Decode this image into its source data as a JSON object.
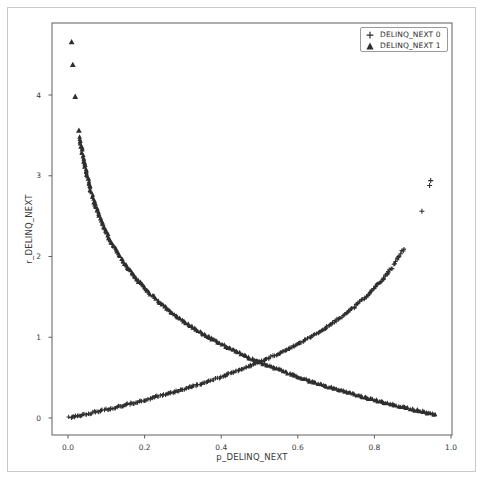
{
  "chart_data": {
    "type": "scatter",
    "title": "",
    "xlabel": "p_DELINQ_NEXT",
    "ylabel": "r_DELINQ_NEXT",
    "xlim": [
      -0.0418,
      1.0026
    ],
    "ylim": [
      -0.2105,
      4.892
    ],
    "grid": false,
    "xticks": {
      "values": [
        0.0,
        0.2,
        0.4,
        0.6,
        0.8,
        1.0
      ],
      "labels": [
        "0.0",
        "0.2",
        "0.4",
        "0.6",
        "0.8",
        "1.0"
      ]
    },
    "yticks": {
      "values": [
        0,
        1,
        2,
        3,
        4
      ],
      "labels": [
        "0",
        "1",
        "2",
        "3",
        "4"
      ]
    },
    "legend": {
      "position": "upper right",
      "entries": [
        {
          "label": "DELINQ_NEXT 0",
          "marker": "plus"
        },
        {
          "label": "DELINQ_NEXT 1",
          "marker": "triangle"
        }
      ]
    },
    "marker_color": "#2e2e2e",
    "series": [
      {
        "name": "DELINQ_NEXT 0",
        "marker": "plus",
        "color": "#2e2e2e",
        "curve_points": [
          [
            0.004,
            0.004
          ],
          [
            0.03,
            0.03
          ],
          [
            0.06,
            0.062
          ],
          [
            0.09,
            0.094
          ],
          [
            0.12,
            0.128
          ],
          [
            0.16,
            0.174
          ],
          [
            0.2,
            0.223
          ],
          [
            0.24,
            0.274
          ],
          [
            0.28,
            0.329
          ],
          [
            0.32,
            0.386
          ],
          [
            0.36,
            0.446
          ],
          [
            0.4,
            0.511
          ],
          [
            0.44,
            0.58
          ],
          [
            0.48,
            0.654
          ],
          [
            0.52,
            0.734
          ],
          [
            0.56,
            0.821
          ],
          [
            0.6,
            0.916
          ],
          [
            0.64,
            1.022
          ],
          [
            0.68,
            1.139
          ],
          [
            0.71,
            1.238
          ],
          [
            0.74,
            1.347
          ],
          [
            0.77,
            1.47
          ],
          [
            0.8,
            1.609
          ],
          [
            0.82,
            1.715
          ],
          [
            0.84,
            1.833
          ],
          [
            0.855,
            1.931
          ],
          [
            0.868,
            2.025
          ],
          [
            0.878,
            2.104
          ]
        ],
        "single_points": [
          [
            0.924,
            2.56
          ],
          [
            0.944,
            2.88
          ],
          [
            0.947,
            2.94
          ]
        ]
      },
      {
        "name": "DELINQ_NEXT 1",
        "marker": "triangle",
        "color": "#2e2e2e",
        "curve_points": [
          [
            0.031,
            3.474
          ],
          [
            0.034,
            3.381
          ],
          [
            0.037,
            3.297
          ],
          [
            0.04,
            3.219
          ],
          [
            0.044,
            3.124
          ],
          [
            0.048,
            3.037
          ],
          [
            0.053,
            2.937
          ],
          [
            0.058,
            2.847
          ],
          [
            0.064,
            2.749
          ],
          [
            0.07,
            2.659
          ],
          [
            0.078,
            2.551
          ],
          [
            0.086,
            2.453
          ],
          [
            0.095,
            2.354
          ],
          [
            0.105,
            2.254
          ],
          [
            0.117,
            2.146
          ],
          [
            0.13,
            2.04
          ],
          [
            0.145,
            1.931
          ],
          [
            0.16,
            1.833
          ],
          [
            0.18,
            1.715
          ],
          [
            0.2,
            1.609
          ],
          [
            0.225,
            1.492
          ],
          [
            0.25,
            1.386
          ],
          [
            0.28,
            1.273
          ],
          [
            0.31,
            1.171
          ],
          [
            0.34,
            1.079
          ],
          [
            0.37,
            0.994
          ],
          [
            0.4,
            0.916
          ],
          [
            0.44,
            0.821
          ],
          [
            0.48,
            0.734
          ],
          [
            0.52,
            0.654
          ],
          [
            0.56,
            0.58
          ],
          [
            0.6,
            0.511
          ],
          [
            0.64,
            0.446
          ],
          [
            0.68,
            0.386
          ],
          [
            0.72,
            0.329
          ],
          [
            0.76,
            0.274
          ],
          [
            0.8,
            0.223
          ],
          [
            0.84,
            0.174
          ],
          [
            0.88,
            0.128
          ],
          [
            0.91,
            0.094
          ],
          [
            0.935,
            0.067
          ],
          [
            0.95,
            0.051
          ],
          [
            0.96,
            0.041
          ]
        ],
        "single_points": [
          [
            0.0095,
            4.657
          ],
          [
            0.0126,
            4.374
          ],
          [
            0.0187,
            3.979
          ],
          [
            0.0284,
            3.561
          ]
        ]
      }
    ]
  }
}
